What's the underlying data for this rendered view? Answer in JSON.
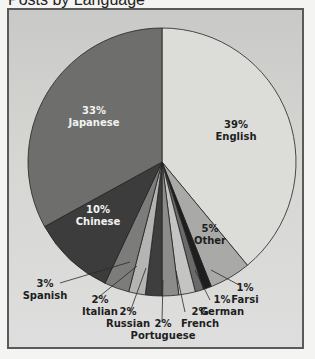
{
  "chart_data": {
    "type": "pie",
    "title": "Posts by Language",
    "categories": [
      "English",
      "Other",
      "Farsi",
      "German",
      "French",
      "Portuguese",
      "Russian",
      "Italian",
      "Spanish",
      "Chinese",
      "Japanese"
    ],
    "values": [
      39,
      5,
      1,
      1,
      2,
      2,
      2,
      2,
      3,
      10,
      33
    ],
    "unit": "%",
    "start_angle_deg": 0,
    "direction": "clockwise",
    "colors": [
      "#dcdcd9",
      "#a9a9a7",
      "#1e1e1e",
      "#6a6a6a",
      "#c4c4c2",
      "#8c8c8a",
      "#3e3e3e",
      "#b4b4b2",
      "#7c7c7a",
      "#3c3c3c",
      "#6e6e6c"
    ],
    "legend": "none (direct labels)",
    "grid": false
  },
  "labels": {
    "english": {
      "pct": "39%",
      "name": "English"
    },
    "japanese": {
      "pct": "33%",
      "name": "Japanese"
    },
    "chinese": {
      "pct": "10%",
      "name": "Chinese"
    },
    "other": {
      "pct": "5%",
      "name": "Other"
    },
    "spanish": {
      "pct": "3%",
      "name": "Spanish"
    },
    "italian": {
      "pct": "2%",
      "name": "Italian"
    },
    "russian": {
      "pct": "2%",
      "name": "Russian"
    },
    "portuguese": {
      "pct": "2%",
      "name": "Portuguese"
    },
    "french": {
      "pct": "2%",
      "name": "French"
    },
    "german": {
      "pct": "1%",
      "name": "German"
    },
    "farsi": {
      "pct": "1%",
      "name": "Farsi"
    }
  },
  "title": "Posts by Language"
}
